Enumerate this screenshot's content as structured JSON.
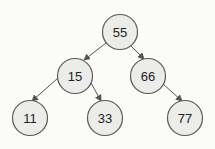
{
  "diagram": {
    "type": "binary-search-tree",
    "nodes": [
      {
        "id": "n55",
        "label": "55",
        "cx": 120,
        "cy": 32
      },
      {
        "id": "n15",
        "label": "15",
        "cx": 75,
        "cy": 76
      },
      {
        "id": "n66",
        "label": "66",
        "cx": 148,
        "cy": 76
      },
      {
        "id": "n11",
        "label": "11",
        "cx": 30,
        "cy": 118
      },
      {
        "id": "n33",
        "label": "33",
        "cx": 105,
        "cy": 118
      },
      {
        "id": "n77",
        "label": "77",
        "cx": 185,
        "cy": 118
      }
    ],
    "edges": [
      {
        "from": "55",
        "to": "15"
      },
      {
        "from": "55",
        "to": "66"
      },
      {
        "from": "15",
        "to": "11"
      },
      {
        "from": "15",
        "to": "33"
      },
      {
        "from": "66",
        "to": "77"
      }
    ]
  }
}
